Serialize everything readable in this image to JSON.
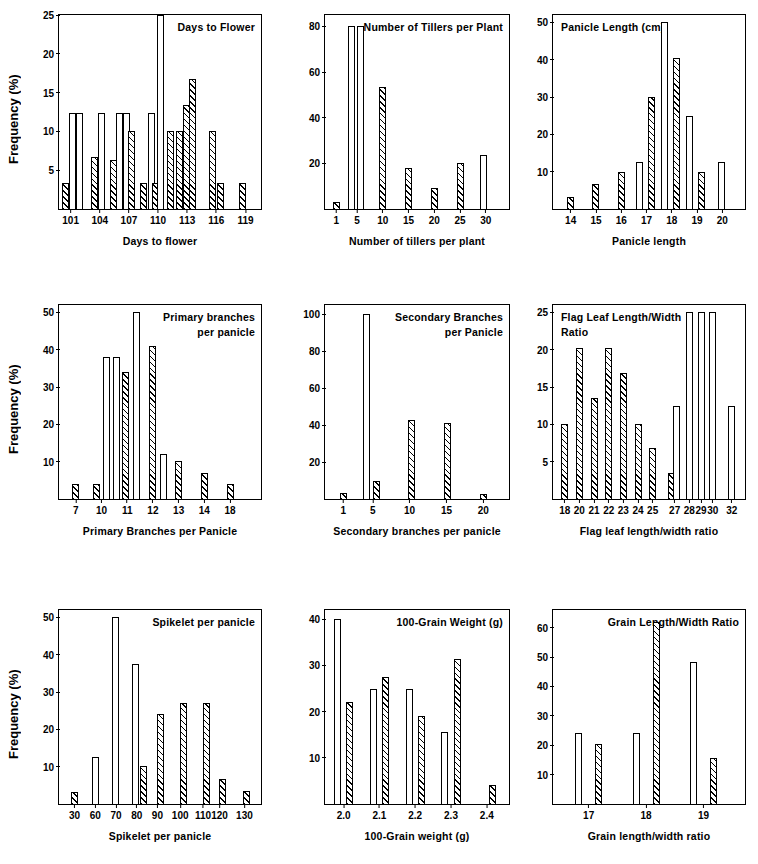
{
  "figure": {
    "y_axis_label": "Frequency (%)",
    "rows": 3,
    "cols": 3
  },
  "chart_data": [
    {
      "type": "bar",
      "panel": 1,
      "title": "Days to Flower",
      "title_align": "right",
      "xlabel": "Days to flower",
      "ylabel": "Frequency (%)",
      "xticks": [
        "101",
        "104",
        "107",
        "110",
        "113",
        "116",
        "119"
      ],
      "xtick_positions": [
        101,
        104,
        107,
        110,
        113,
        116,
        119
      ],
      "xlim": [
        99.8,
        120.6
      ],
      "ylim": [
        0,
        25
      ],
      "yticks": [
        5,
        10,
        15,
        20,
        25
      ],
      "grid": false,
      "bars": [
        {
          "x": 100.5,
          "value": 3.3,
          "fill": "hatch"
        },
        {
          "x": 101.2,
          "value": 12.4,
          "fill": "white"
        },
        {
          "x": 101.9,
          "value": 12.4,
          "fill": "white"
        },
        {
          "x": 103.5,
          "value": 6.7,
          "fill": "hatch"
        },
        {
          "x": 104.2,
          "value": 12.4,
          "fill": "white"
        },
        {
          "x": 105.4,
          "value": 6.3,
          "fill": "hatch"
        },
        {
          "x": 106.0,
          "value": 12.4,
          "fill": "white"
        },
        {
          "x": 106.7,
          "value": 12.4,
          "fill": "white"
        },
        {
          "x": 107.3,
          "value": 10.0,
          "fill": "hatch"
        },
        {
          "x": 108.5,
          "value": 3.3,
          "fill": "hatch"
        },
        {
          "x": 109.3,
          "value": 12.4,
          "fill": "white"
        },
        {
          "x": 109.7,
          "value": 3.4,
          "fill": "hatch"
        },
        {
          "x": 110.2,
          "value": 25.0,
          "fill": "white"
        },
        {
          "x": 111.3,
          "value": 10.0,
          "fill": "hatch"
        },
        {
          "x": 112.2,
          "value": 10.0,
          "fill": "hatch"
        },
        {
          "x": 112.9,
          "value": 13.4,
          "fill": "hatch"
        },
        {
          "x": 113.5,
          "value": 16.8,
          "fill": "hatch"
        },
        {
          "x": 115.6,
          "value": 10.0,
          "fill": "hatch"
        },
        {
          "x": 116.4,
          "value": 3.4,
          "fill": "hatch"
        },
        {
          "x": 118.7,
          "value": 3.4,
          "fill": "hatch"
        }
      ]
    },
    {
      "type": "bar",
      "panel": 2,
      "title": "Number of Tillers per Plant",
      "title_align": "right",
      "xlabel": "Number of tillers per plant",
      "ylabel": "Frequency (%)",
      "xticks": [
        "1",
        "5",
        "10",
        "15",
        "20",
        "25",
        "30"
      ],
      "xtick_positions": [
        1,
        5,
        10,
        15,
        20,
        25,
        30
      ],
      "xlim": [
        -1.2,
        34.5
      ],
      "ylim": [
        0,
        85
      ],
      "yticks": [
        20,
        40,
        60,
        80
      ],
      "grid": false,
      "bars": [
        {
          "x": 1.0,
          "value": 3.0,
          "fill": "hatch"
        },
        {
          "x": 4.0,
          "value": 80.0,
          "fill": "white"
        },
        {
          "x": 5.6,
          "value": 80.0,
          "fill": "white"
        },
        {
          "x": 10.0,
          "value": 53.5,
          "fill": "hatch"
        },
        {
          "x": 15.0,
          "value": 18.0,
          "fill": "hatch"
        },
        {
          "x": 20.0,
          "value": 9.0,
          "fill": "hatch"
        },
        {
          "x": 25.0,
          "value": 20.0,
          "fill": "hatch"
        },
        {
          "x": 29.5,
          "value": 23.5,
          "fill": "white"
        }
      ]
    },
    {
      "type": "bar",
      "panel": 3,
      "title": "Panicle Length (cm)",
      "title_align": "left",
      "xlabel": "Panicle length",
      "ylabel": "Frequency (%)",
      "xticks": [
        "14",
        "15",
        "16",
        "17",
        "18",
        "19",
        "20"
      ],
      "xtick_positions": [
        14,
        15,
        16,
        17,
        18,
        19,
        20
      ],
      "xlim": [
        13.3,
        20.9
      ],
      "ylim": [
        0,
        52
      ],
      "yticks": [
        10,
        20,
        30,
        40,
        50
      ],
      "grid": false,
      "bars": [
        {
          "x": 14.0,
          "value": 3.2,
          "fill": "hatch"
        },
        {
          "x": 15.0,
          "value": 6.8,
          "fill": "hatch"
        },
        {
          "x": 16.0,
          "value": 10.0,
          "fill": "hatch"
        },
        {
          "x": 16.72,
          "value": 12.5,
          "fill": "white"
        },
        {
          "x": 17.18,
          "value": 30.0,
          "fill": "hatch"
        },
        {
          "x": 17.72,
          "value": 50.0,
          "fill": "white"
        },
        {
          "x": 18.18,
          "value": 40.5,
          "fill": "hatch"
        },
        {
          "x": 18.72,
          "value": 25.0,
          "fill": "white"
        },
        {
          "x": 19.18,
          "value": 10.0,
          "fill": "hatch"
        },
        {
          "x": 19.95,
          "value": 12.5,
          "fill": "white"
        }
      ]
    },
    {
      "type": "bar",
      "panel": 4,
      "title": "Primary branches\nper panicle",
      "title_align": "right",
      "xlabel": "Primary Branches per Panicle",
      "ylabel": "Frequency (%)",
      "xticks": [
        "7",
        "10",
        "11",
        "12",
        "13",
        "14",
        "18"
      ],
      "xtick_positions": [
        0,
        1,
        2,
        3,
        4,
        5,
        6
      ],
      "xlim": [
        -0.65,
        7.2
      ],
      "ylim": [
        0,
        52
      ],
      "yticks": [
        10,
        20,
        30,
        40,
        50
      ],
      "grid": false,
      "bars": [
        {
          "x": 0.0,
          "value": 4.0,
          "fill": "hatch"
        },
        {
          "x": 0.82,
          "value": 4.0,
          "fill": "hatch"
        },
        {
          "x": 1.18,
          "value": 38.0,
          "fill": "white"
        },
        {
          "x": 1.58,
          "value": 38.0,
          "fill": "white"
        },
        {
          "x": 1.95,
          "value": 34.0,
          "fill": "hatch"
        },
        {
          "x": 2.35,
          "value": 50.0,
          "fill": "white"
        },
        {
          "x": 3.0,
          "value": 41.0,
          "fill": "hatch"
        },
        {
          "x": 3.42,
          "value": 12.2,
          "fill": "white"
        },
        {
          "x": 4.0,
          "value": 10.2,
          "fill": "hatch"
        },
        {
          "x": 5.0,
          "value": 7.0,
          "fill": "hatch"
        },
        {
          "x": 6.0,
          "value": 4.0,
          "fill": "hatch"
        }
      ]
    },
    {
      "type": "bar",
      "panel": 5,
      "title": "Secondary Branches\nper Panicle",
      "title_align": "right",
      "xlabel": "Secondary branches per panicle",
      "ylabel": "Frequency (%)",
      "xticks": [
        "1",
        "5",
        "10",
        "15",
        "20"
      ],
      "xtick_positions": [
        1,
        5,
        10,
        15,
        20
      ],
      "xlim": [
        -1.5,
        23.5
      ],
      "ylim": [
        0,
        105
      ],
      "yticks": [
        20,
        40,
        60,
        80,
        100
      ],
      "grid": false,
      "bars": [
        {
          "x": 1.0,
          "value": 3.0,
          "fill": "hatch"
        },
        {
          "x": 4.1,
          "value": 100.0,
          "fill": "white"
        },
        {
          "x": 5.5,
          "value": 10.0,
          "fill": "hatch"
        },
        {
          "x": 10.2,
          "value": 43.0,
          "fill": "hatch"
        },
        {
          "x": 15.2,
          "value": 41.0,
          "fill": "hatch"
        },
        {
          "x": 20.0,
          "value": 2.5,
          "fill": "hatch"
        }
      ]
    },
    {
      "type": "bar",
      "panel": 6,
      "title": "Flag Leaf Length/Width\nRatio",
      "title_align": "left",
      "xlabel": "Flag leaf length/width ratio",
      "ylabel": "Frequency (%)",
      "xticks": [
        "18",
        "20",
        "21",
        "22",
        "23",
        "24",
        "25",
        "27",
        "28",
        "29",
        "30",
        "32"
      ],
      "xtick_positions": [
        0,
        1,
        2,
        3,
        4,
        5,
        6,
        7.5,
        8.5,
        9.3,
        10.1,
        11.4
      ],
      "xlim": [
        -0.8,
        12.3
      ],
      "ylim": [
        0,
        26
      ],
      "yticks": [
        5,
        10,
        15,
        20,
        25
      ],
      "grid": false,
      "bars": [
        {
          "x": 0.0,
          "value": 10.0,
          "fill": "hatch"
        },
        {
          "x": 1.0,
          "value": 20.3,
          "fill": "hatch"
        },
        {
          "x": 2.0,
          "value": 13.5,
          "fill": "hatch"
        },
        {
          "x": 3.0,
          "value": 20.3,
          "fill": "hatch"
        },
        {
          "x": 4.0,
          "value": 16.9,
          "fill": "hatch"
        },
        {
          "x": 5.0,
          "value": 10.0,
          "fill": "hatch"
        },
        {
          "x": 6.0,
          "value": 6.8,
          "fill": "hatch"
        },
        {
          "x": 7.3,
          "value": 3.5,
          "fill": "hatch"
        },
        {
          "x": 7.65,
          "value": 12.4,
          "fill": "white"
        },
        {
          "x": 8.5,
          "value": 25.0,
          "fill": "white"
        },
        {
          "x": 9.3,
          "value": 25.0,
          "fill": "white"
        },
        {
          "x": 10.1,
          "value": 25.0,
          "fill": "white"
        },
        {
          "x": 11.4,
          "value": 12.4,
          "fill": "white"
        }
      ]
    },
    {
      "type": "bar",
      "panel": 7,
      "title": "Spikelet per panicle",
      "title_align": "right",
      "xlabel": "Spikelet per panicle",
      "ylabel": "Frequency (%)",
      "xticks": [
        "30",
        "60",
        "70",
        "80",
        "90",
        "100",
        "110",
        "120",
        "130"
      ],
      "xtick_positions": [
        0,
        1,
        2,
        3,
        4,
        5.1,
        6.2,
        7.0,
        8.2
      ],
      "xlim": [
        -0.75,
        9.0
      ],
      "ylim": [
        0,
        52
      ],
      "yticks": [
        10,
        20,
        30,
        40,
        50
      ],
      "grid": false,
      "bars": [
        {
          "x": 0.0,
          "value": 3.2,
          "fill": "hatch"
        },
        {
          "x": 1.0,
          "value": 12.5,
          "fill": "white"
        },
        {
          "x": 2.0,
          "value": 50.0,
          "fill": "white"
        },
        {
          "x": 2.92,
          "value": 37.5,
          "fill": "white"
        },
        {
          "x": 3.32,
          "value": 10.2,
          "fill": "hatch"
        },
        {
          "x": 4.15,
          "value": 24.0,
          "fill": "hatch"
        },
        {
          "x": 5.25,
          "value": 27.2,
          "fill": "hatch"
        },
        {
          "x": 6.35,
          "value": 27.2,
          "fill": "hatch"
        },
        {
          "x": 7.15,
          "value": 6.8,
          "fill": "hatch"
        },
        {
          "x": 8.3,
          "value": 3.4,
          "fill": "hatch"
        }
      ]
    },
    {
      "type": "bar",
      "panel": 8,
      "title": "100-Grain Weight (g)",
      "title_align": "right",
      "xlabel": "100-Grain weight (g)",
      "ylabel": "Frequency (%)",
      "xticks": [
        "2.0",
        "2.1",
        "2.2",
        "2.3",
        "2.4"
      ],
      "xtick_positions": [
        0,
        1,
        2,
        3,
        4
      ],
      "xlim": [
        -0.52,
        4.62
      ],
      "ylim": [
        0,
        42
      ],
      "yticks": [
        10,
        20,
        30,
        40
      ],
      "grid": false,
      "bars": [
        {
          "x": -0.17,
          "value": 40.0,
          "fill": "white"
        },
        {
          "x": 0.17,
          "value": 22.0,
          "fill": "hatch"
        },
        {
          "x": 0.83,
          "value": 25.0,
          "fill": "white"
        },
        {
          "x": 1.17,
          "value": 27.5,
          "fill": "hatch"
        },
        {
          "x": 1.83,
          "value": 25.0,
          "fill": "white"
        },
        {
          "x": 2.17,
          "value": 19.0,
          "fill": "hatch"
        },
        {
          "x": 2.83,
          "value": 15.5,
          "fill": "white"
        },
        {
          "x": 3.17,
          "value": 31.5,
          "fill": "hatch"
        },
        {
          "x": 4.15,
          "value": 4.2,
          "fill": "hatch"
        }
      ]
    },
    {
      "type": "bar",
      "panel": 9,
      "title": "Grain Length/Width Ratio",
      "title_align": "right",
      "xlabel": "Grain length/width ratio",
      "ylabel": "Frequency (%)",
      "xticks": [
        "17",
        "18",
        "19"
      ],
      "xtick_positions": [
        0,
        1,
        2
      ],
      "xlim": [
        -0.62,
        2.72
      ],
      "ylim": [
        0,
        66
      ],
      "yticks": [
        10,
        20,
        30,
        40,
        50,
        60
      ],
      "grid": false,
      "bars": [
        {
          "x": -0.17,
          "value": 24.0,
          "fill": "white"
        },
        {
          "x": 0.18,
          "value": 20.3,
          "fill": "hatch"
        },
        {
          "x": 0.83,
          "value": 24.0,
          "fill": "white"
        },
        {
          "x": 1.18,
          "value": 62.0,
          "fill": "hatch"
        },
        {
          "x": 1.83,
          "value": 48.3,
          "fill": "white"
        },
        {
          "x": 2.18,
          "value": 15.5,
          "fill": "hatch"
        }
      ]
    }
  ]
}
